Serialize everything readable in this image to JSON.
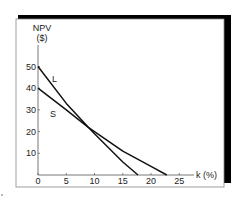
{
  "chart_data": {
    "type": "line",
    "title": "",
    "xlabel": "k (%)",
    "ylabel": "NPV ($)",
    "ylabel_lines": [
      "NPV",
      "($)"
    ],
    "xlim": [
      0,
      28
    ],
    "ylim": [
      0,
      55
    ],
    "x_ticks": [
      0,
      5,
      10,
      15,
      20,
      25
    ],
    "y_ticks": [
      10,
      20,
      30,
      40,
      50
    ],
    "x_tick_labels": [
      "0",
      "5",
      "10",
      "15",
      "20",
      "25"
    ],
    "y_tick_labels": [
      "10",
      "20",
      "30",
      "40",
      "50"
    ],
    "grid": false,
    "legend": "inline labels",
    "series": [
      {
        "name": "L",
        "x": [
          0,
          5,
          8.9,
          10,
          15,
          17.7
        ],
        "values": [
          50,
          33,
          22,
          19,
          6,
          0
        ]
      },
      {
        "name": "S",
        "x": [
          0,
          5,
          8.9,
          10,
          15,
          20,
          22.8
        ],
        "values": [
          40,
          30,
          22,
          20,
          11,
          4,
          0
        ]
      }
    ],
    "annotations": [
      {
        "text": "L",
        "near": "series L"
      },
      {
        "text": "S",
        "near": "series S"
      }
    ]
  },
  "colors": {
    "line": "#111111",
    "frame_shadow": "#000000",
    "background": "#ffffff"
  }
}
